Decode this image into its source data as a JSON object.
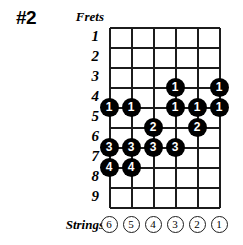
{
  "title": "#2",
  "labels": {
    "frets": "Frets",
    "strings": "Strings"
  },
  "colors": {
    "dot_fill": "#000000",
    "dot_text": "#ffffff",
    "grid_line": "#1c1c1c",
    "background": "#ffffff"
  },
  "geometry": {
    "grid_left": 109,
    "grid_top": 27,
    "string_spacing": 22,
    "fret_spacing": 20,
    "string_count": 6,
    "fret_count": 9
  },
  "chart_data": {
    "type": "fretboard-diagram",
    "title": "#2",
    "xlabel": "Strings",
    "ylabel": "Frets",
    "fret_numbers": [
      "1",
      "2",
      "3",
      "4",
      "5",
      "6",
      "7",
      "8",
      "9"
    ],
    "string_numbers": [
      "6",
      "5",
      "4",
      "3",
      "2",
      "1"
    ],
    "dots": [
      {
        "fret": 3,
        "string": 3,
        "finger": "1"
      },
      {
        "fret": 3,
        "string": 1,
        "finger": "1"
      },
      {
        "fret": 4,
        "string": 6,
        "finger": "1"
      },
      {
        "fret": 4,
        "string": 5,
        "finger": "1"
      },
      {
        "fret": 4,
        "string": 3,
        "finger": "1"
      },
      {
        "fret": 4,
        "string": 2,
        "finger": "1"
      },
      {
        "fret": 4,
        "string": 1,
        "finger": "1"
      },
      {
        "fret": 5,
        "string": 4,
        "finger": "2"
      },
      {
        "fret": 5,
        "string": 2,
        "finger": "2"
      },
      {
        "fret": 6,
        "string": 6,
        "finger": "3"
      },
      {
        "fret": 6,
        "string": 5,
        "finger": "3"
      },
      {
        "fret": 6,
        "string": 4,
        "finger": "3"
      },
      {
        "fret": 6,
        "string": 3,
        "finger": "3"
      },
      {
        "fret": 7,
        "string": 6,
        "finger": "4"
      },
      {
        "fret": 7,
        "string": 5,
        "finger": "4"
      }
    ]
  }
}
